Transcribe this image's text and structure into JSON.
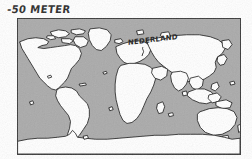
{
  "figure": {
    "caption": "-50 METER",
    "background_color": "#ffffff"
  },
  "map": {
    "frame_color": "#3a3a3a",
    "ocean_color": "#aaaaaa",
    "land_color": "#ffffff",
    "coastline_color": "#1a1a1a",
    "projection": "equirectangular",
    "sea_level_offset_m": -50,
    "annotations": [
      {
        "name": "nederland-annotation",
        "label": "NEDERLAND",
        "target_region": "Netherlands / North Sea"
      }
    ],
    "landmasses": [
      "North America",
      "Greenland",
      "Canadian Arctic Archipelago",
      "South America",
      "Europe",
      "Africa",
      "Madagascar",
      "Asia",
      "Indonesia",
      "Australia",
      "New Zealand",
      "Antarctica"
    ]
  }
}
